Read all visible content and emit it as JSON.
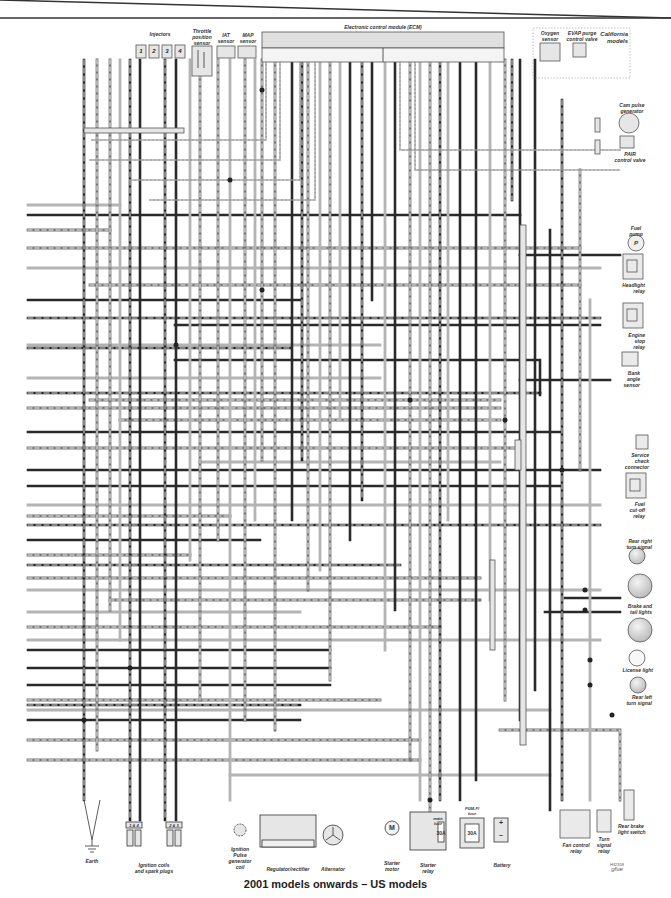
{
  "diagram": {
    "title": "2001 models onwards – US models",
    "reference": "H32358",
    "signature": "gfue",
    "top_components": {
      "injectors": {
        "label": "Injectors",
        "numbers": [
          "1",
          "2",
          "3",
          "4"
        ]
      },
      "throttle_position_sensor": "Throttle\nposition\nsensor",
      "iat_sensor": "IAT\nsensor",
      "map_sensor": "MAP\nsensor",
      "ecm": "Electronic control module (ECM)",
      "oxygen_sensor": "Oxygen\nsensor",
      "evap_purge_control_valve": "EVAP purge\ncontrol valve",
      "california_models": "California\nmodels"
    },
    "right_components": [
      {
        "id": "cam_pulse_generator",
        "label": "Cam pulse\ngenerator"
      },
      {
        "id": "pair_control_valve",
        "label": "PAIR\ncontrol valve"
      },
      {
        "id": "fuel_pump",
        "label": "Fuel\npump",
        "symbol": "P"
      },
      {
        "id": "headlight_relay",
        "label": "Headlight\nrelay"
      },
      {
        "id": "engine_stop_relay",
        "label": "Engine\nstop\nrelay"
      },
      {
        "id": "bank_angle_sensor",
        "label": "Bank\nangle\nsensor"
      },
      {
        "id": "service_check_connector",
        "label": "Service\ncheck\nconnector"
      },
      {
        "id": "fuel_cutoff_relay",
        "label": "Fuel\ncut-off\nrelay"
      },
      {
        "id": "rear_right_turn_signal",
        "label": "Rear right\nturn signal"
      },
      {
        "id": "brake_tail_lights",
        "label": "Brake and\ntail lights"
      },
      {
        "id": "license_light",
        "label": "License light"
      },
      {
        "id": "rear_left_turn_signal",
        "label": "Rear left\nturn signal"
      },
      {
        "id": "rear_brake_light_switch",
        "label": "Rear brake\nlight switch"
      }
    ],
    "bottom_components": [
      {
        "id": "earth",
        "label": "Earth"
      },
      {
        "id": "ignition_coils",
        "label": "Ignition coils\nand spark plugs",
        "pairs": [
          "1 & 4",
          "2 & 3"
        ]
      },
      {
        "id": "ignition_pulse_generator",
        "label": "Ignition\nPulse\ngenerator\ncoil"
      },
      {
        "id": "regulator_rectifier",
        "label": "Regulator/rectifier"
      },
      {
        "id": "alternator",
        "label": "Alternator"
      },
      {
        "id": "starter_motor",
        "label": "Starter\nmotor",
        "symbol": "M"
      },
      {
        "id": "starter_relay",
        "label": "Starter\nrelay",
        "main_fuse_label": "main\nfuse",
        "fuse_rating": "30A"
      },
      {
        "id": "pgm_fi_fuse",
        "label": "PGM-FI\nfuse",
        "fuse_rating": "30A"
      },
      {
        "id": "battery",
        "label": "Battery",
        "symbols": [
          "+",
          "–"
        ]
      },
      {
        "id": "fan_control_relay",
        "label": "Fan control\nrelay"
      },
      {
        "id": "turn_signal_relay",
        "label": "Turn\nsignal\nrelay"
      }
    ],
    "colors": {
      "wire_dark": "#2a2a2a",
      "wire_mid": "#6e6e6e",
      "wire_light": "#b4b4b4",
      "component_fill": "#e6e6e6",
      "component_stroke": "#555555"
    }
  }
}
